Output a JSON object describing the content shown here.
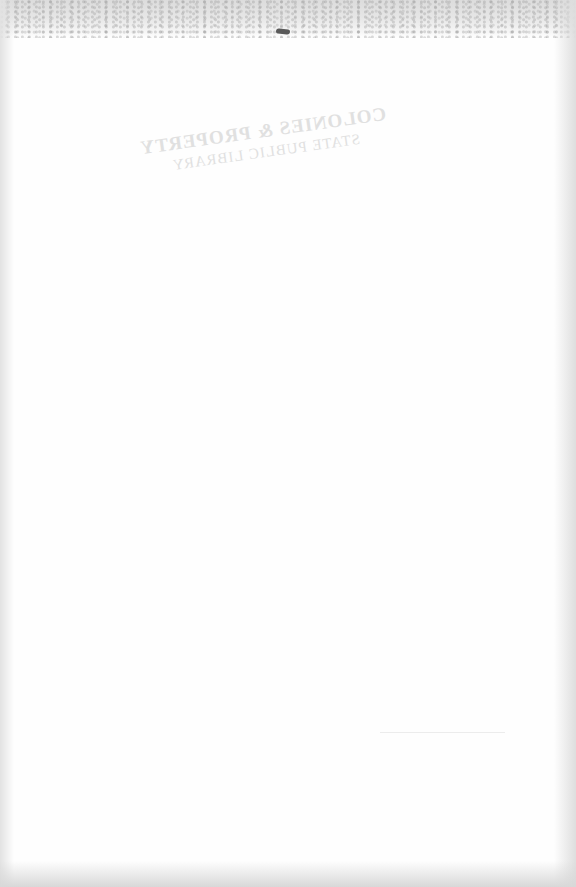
{
  "page": {
    "type": "blank scanned page (verso)",
    "show_through": {
      "line1": "COLONIES & PROPERTY",
      "line2": "STATE PUBLIC LIBRARY",
      "line3": "",
      "mirrored": true
    }
  },
  "colors": {
    "paper": "#fefefe",
    "edge_shadow": "#dcdcdc",
    "speck": "#5a5a5a",
    "show_through_text": "#c9c9c9"
  }
}
